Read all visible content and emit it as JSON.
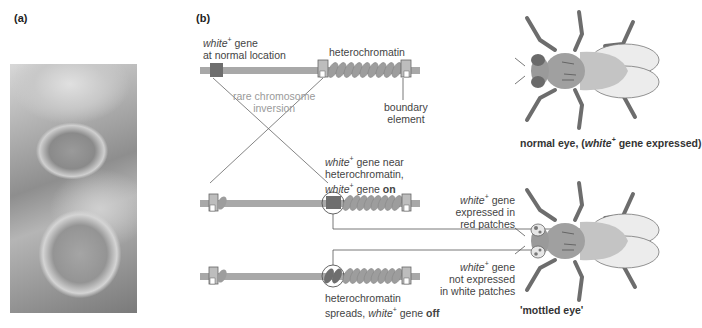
{
  "panels": {
    "a": {
      "label": "(a)"
    },
    "b": {
      "label": "(b)"
    }
  },
  "photo": {
    "description": "micrograph of two Drosophila compound eyes (grayscale)"
  },
  "chromosome_top": {
    "gene_label_italic": "white",
    "gene_label_sup": "+",
    "gene_label_rest": " gene",
    "gene_label_line2": "at normal location",
    "heterochromatin_label": "heterochromatin",
    "boundary_label_line1": "boundary",
    "boundary_label_line2": "element"
  },
  "inversion": {
    "line1": "rare chromosome",
    "line2": "inversion"
  },
  "chromosome_middle": {
    "line1_italic": "white",
    "line1_sup": "+",
    "line1_rest": " gene near",
    "line2": "heterochromatin,",
    "line3_italic": "white",
    "line3_sup": "+",
    "line3_rest": " gene ",
    "line3_bold": "on"
  },
  "chromosome_bottom": {
    "line1": "heterochromatin",
    "line2_pre": "spreads, ",
    "line2_italic": "white",
    "line2_sup": "+",
    "line2_rest": " gene ",
    "line2_bold": "off"
  },
  "fly_top": {
    "caption_pre": "normal eye, (",
    "caption_italic": "white",
    "caption_sup": "+",
    "caption_post": " gene expressed)"
  },
  "fly_bottom": {
    "red_label_italic": "white",
    "red_label_sup": "+",
    "red_label_rest": " gene",
    "red_label_line2": "expressed in",
    "red_label_line3": "red patches",
    "white_label_italic": "white",
    "white_label_sup": "+",
    "white_label_rest": " gene",
    "white_label_line2": "not expressed",
    "white_label_line3": "in white patches",
    "caption": "'mottled eye'"
  },
  "colors": {
    "chromosome": "#a8a8a8",
    "gene": "#6e6e6e",
    "heterochromatin": "#9d9d9d",
    "fly_body": "#a0a0a0",
    "fly_legs": "#6d6d6d",
    "wing_fill": "#ececec",
    "line": "#555555"
  }
}
